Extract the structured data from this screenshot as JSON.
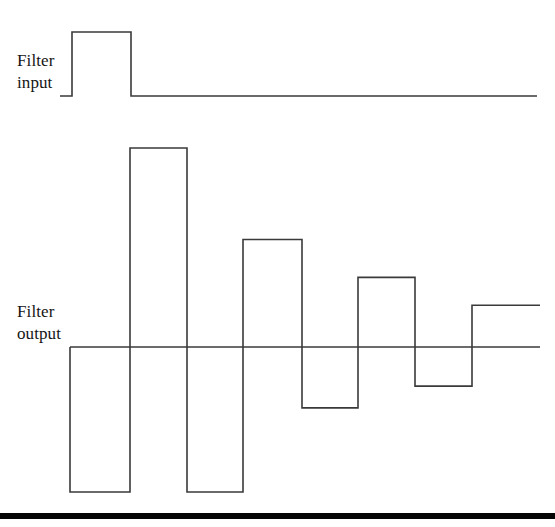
{
  "figure": {
    "background_color": "#ffffff",
    "trace_color": "#3a3a3a",
    "rule_color": "#050505",
    "labels": {
      "input": "Filter\ninput",
      "input_line1": "Filter",
      "input_line2": "input",
      "output": "Filter\noutput",
      "output_line1": "Filter",
      "output_line2": "output"
    }
  },
  "chart_data": [
    {
      "type": "line",
      "name": "filter-input",
      "title": "Filter input",
      "xlabel": "",
      "ylabel": "",
      "style": "step",
      "baseline_y": 96,
      "xlim": [
        60,
        537
      ],
      "description": "Single rectangular unit pulse followed by zero",
      "x": [
        60,
        72,
        72,
        131,
        131,
        537
      ],
      "y": [
        0,
        0,
        1,
        1,
        0,
        0
      ],
      "segments": [
        {
          "index": 0,
          "x_start": 60,
          "x_end": 72,
          "value": 0
        },
        {
          "index": 1,
          "x_start": 72,
          "x_end": 131,
          "value": 1
        },
        {
          "index": 2,
          "x_start": 131,
          "x_end": 537,
          "value": 0
        }
      ]
    },
    {
      "type": "line",
      "name": "filter-output",
      "title": "Filter output",
      "xlabel": "",
      "ylabel": "",
      "style": "step",
      "baseline_y": 347,
      "xlim": [
        70,
        540
      ],
      "description": "Damped alternating-sign step response, magnitudes decaying",
      "categories": [
        "1",
        "2",
        "3",
        "4",
        "5",
        "6",
        "7",
        "8"
      ],
      "values": [
        -1.0,
        1.0,
        -1.0,
        0.54,
        -0.42,
        0.35,
        -0.27,
        0.21
      ],
      "segments": [
        {
          "index": 0,
          "x_start": 70,
          "x_end": 130,
          "value": -1.0,
          "sign": "negative"
        },
        {
          "index": 1,
          "x_start": 130,
          "x_end": 187,
          "value": 1.0,
          "sign": "positive"
        },
        {
          "index": 2,
          "x_start": 187,
          "x_end": 243,
          "value": -1.0,
          "sign": "negative"
        },
        {
          "index": 3,
          "x_start": 243,
          "x_end": 302,
          "value": 0.54,
          "sign": "positive"
        },
        {
          "index": 4,
          "x_start": 302,
          "x_end": 358,
          "value": -0.42,
          "sign": "negative"
        },
        {
          "index": 5,
          "x_start": 358,
          "x_end": 415,
          "value": 0.35,
          "sign": "positive"
        },
        {
          "index": 6,
          "x_start": 415,
          "x_end": 472,
          "value": -0.27,
          "sign": "negative"
        },
        {
          "index": 7,
          "x_start": 472,
          "x_end": 540,
          "value": 0.21,
          "sign": "positive"
        }
      ]
    }
  ]
}
